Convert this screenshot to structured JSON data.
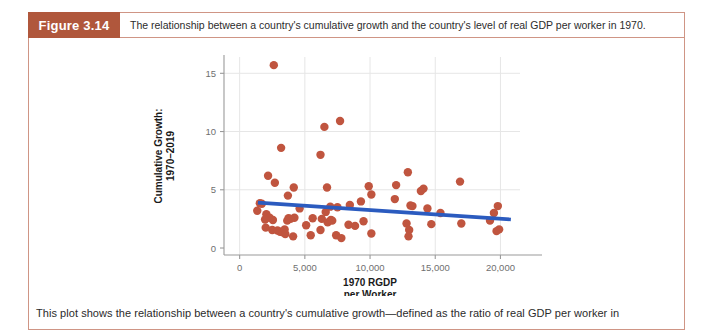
{
  "figure": {
    "badge_label": "Figure 3.14",
    "header_caption": "The relationship between a country's cumulative growth and the country's level of real GDP per worker in 1970.",
    "note": "This plot shows the relationship between a country's cumulative growth—defined as the ratio of real GDP per worker in",
    "badge_color": "#b0573c",
    "frame_color": "#cf9585"
  },
  "chart_data": {
    "type": "scatter",
    "title": "",
    "xlabel": "1970 RGDP per Worker",
    "xlabel_line1": "1970 RGDP",
    "xlabel_line2": "per Worker",
    "ylabel": "Cumulative Growth: 1970–2019",
    "ylabel_line1": "Cumulative Growth:",
    "ylabel_line2": "1970–2019",
    "xlim": [
      -1200,
      21500
    ],
    "ylim": [
      -0.6,
      16.4
    ],
    "xticks": [
      0,
      5000,
      10000,
      15000,
      20000
    ],
    "xticklabels": [
      "0",
      "5,000",
      "10,000",
      "15,000",
      "20,000"
    ],
    "yticks": [
      0,
      5,
      10,
      15
    ],
    "yticklabels": [
      "0",
      "5",
      "10",
      "15"
    ],
    "grid": true,
    "grid_color": "#e6e6e6",
    "legend": false,
    "point_color": "#c0553f",
    "point_size": 4.2,
    "series": [
      {
        "name": "Countries",
        "points": [
          [
            2620,
            15.7
          ],
          [
            7700,
            10.9
          ],
          [
            6500,
            10.4
          ],
          [
            3180,
            8.6
          ],
          [
            6200,
            8.0
          ],
          [
            2180,
            6.2
          ],
          [
            2700,
            5.6
          ],
          [
            12900,
            6.5
          ],
          [
            12000,
            5.4
          ],
          [
            14100,
            5.1
          ],
          [
            13900,
            4.9
          ],
          [
            16900,
            5.7
          ],
          [
            4150,
            5.2
          ],
          [
            6700,
            5.2
          ],
          [
            9900,
            5.3
          ],
          [
            3700,
            4.5
          ],
          [
            10100,
            4.6
          ],
          [
            1550,
            3.85
          ],
          [
            1700,
            3.8
          ],
          [
            9300,
            4.0
          ],
          [
            11900,
            4.2
          ],
          [
            1350,
            3.2
          ],
          [
            2050,
            2.9
          ],
          [
            13100,
            3.65
          ],
          [
            13250,
            3.6
          ],
          [
            14400,
            3.4
          ],
          [
            15400,
            3.0
          ],
          [
            19500,
            3.0
          ],
          [
            19800,
            3.6
          ],
          [
            8450,
            3.7
          ],
          [
            6600,
            3.1
          ],
          [
            6950,
            3.55
          ],
          [
            7500,
            3.5
          ],
          [
            4600,
            3.4
          ],
          [
            2300,
            2.6
          ],
          [
            2550,
            2.4
          ],
          [
            4200,
            2.6
          ],
          [
            3750,
            2.55
          ],
          [
            3900,
            2.5
          ],
          [
            3650,
            2.35
          ],
          [
            2000,
            1.75
          ],
          [
            2500,
            1.55
          ],
          [
            2900,
            1.5
          ],
          [
            3100,
            1.4
          ],
          [
            3300,
            1.35
          ],
          [
            3450,
            1.6
          ],
          [
            3500,
            1.2
          ],
          [
            4100,
            1.0
          ],
          [
            5450,
            1.1
          ],
          [
            6200,
            1.55
          ],
          [
            6300,
            2.5
          ],
          [
            6750,
            2.2
          ],
          [
            7000,
            2.4
          ],
          [
            7100,
            2.35
          ],
          [
            7400,
            1.1
          ],
          [
            7800,
            0.85
          ],
          [
            8350,
            2.0
          ],
          [
            8850,
            1.9
          ],
          [
            9500,
            2.3
          ],
          [
            10100,
            1.25
          ],
          [
            12800,
            2.1
          ],
          [
            13000,
            1.55
          ],
          [
            12950,
            1.0
          ],
          [
            14700,
            2.05
          ],
          [
            17000,
            2.1
          ],
          [
            19200,
            2.35
          ],
          [
            19900,
            1.6
          ],
          [
            19700,
            1.45
          ],
          [
            5100,
            1.95
          ],
          [
            5600,
            2.55
          ],
          [
            1950,
            2.45
          ]
        ]
      }
    ],
    "trendline": {
      "name": "Fitted regression line",
      "color": "#2b5bbf",
      "width": 3.6,
      "x_start": 1400,
      "y_start": 3.9,
      "x_end": 20800,
      "y_end": 2.45
    }
  }
}
